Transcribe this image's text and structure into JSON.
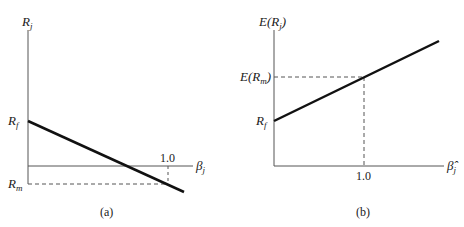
{
  "panels": [
    {
      "id": "a",
      "caption": "(a)",
      "y_axis_label": "R",
      "y_axis_sub": "j",
      "x_axis_label": "β",
      "x_axis_sub": "j",
      "y_marks": [
        {
          "label": "R",
          "sub": "f"
        },
        {
          "label": "R",
          "sub": "m"
        }
      ],
      "x_tick": "1.0"
    },
    {
      "id": "b",
      "caption": "(b)",
      "y_axis_label": "E(R",
      "y_axis_sub": "j",
      "y_axis_close": ")",
      "x_axis_label": "β̂",
      "x_axis_sub": "j",
      "y_marks": [
        {
          "label": "E(R",
          "sub": "m",
          "close": ")"
        },
        {
          "label": "R",
          "sub": "f"
        }
      ],
      "x_tick": "1.0"
    }
  ],
  "colors": {
    "axis": "#555555",
    "line": "#111111",
    "dashed": "#555555"
  }
}
